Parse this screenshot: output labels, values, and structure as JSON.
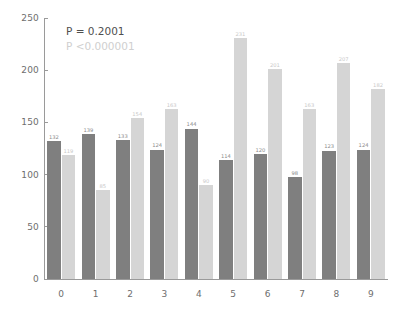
{
  "chart_data": {
    "type": "bar",
    "title": "",
    "xlabel": "",
    "ylabel": "",
    "categories": [
      "0",
      "1",
      "2",
      "3",
      "4",
      "5",
      "6",
      "7",
      "8",
      "9"
    ],
    "series": [
      {
        "name": "dark",
        "color": "#7f7f7f",
        "values": [
          132,
          139,
          133,
          124,
          144,
          114,
          120,
          98,
          123,
          124
        ]
      },
      {
        "name": "light",
        "color": "#d5d5d5",
        "values": [
          119,
          85,
          154,
          163,
          90,
          231,
          201,
          163,
          207,
          182
        ]
      }
    ],
    "ylim": [
      0,
      250
    ],
    "yticks": [
      0,
      50,
      100,
      150,
      200,
      250
    ],
    "grid": false,
    "legend": "none",
    "annotations": [
      {
        "text": "P = 0.2001",
        "color": "#4f4f4f"
      },
      {
        "text": "P <0.000001",
        "color": "#cfcfcf"
      }
    ]
  }
}
